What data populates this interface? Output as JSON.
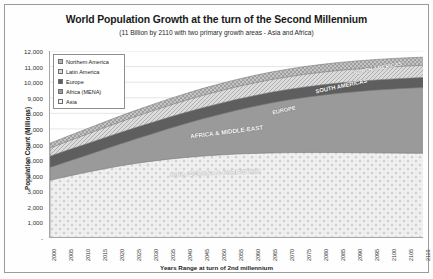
{
  "chart_data": {
    "type": "area",
    "stacked": true,
    "title": "World Population Growth at the turn of the Second Millennium",
    "subtitle": "(11 Billion  by  2110 with two primary growth areas - Asia and Africa)",
    "xlabel": "Years Range at turn of 2nd millennium",
    "ylabel": "Population Count (Millions)",
    "ylim": [
      0,
      12000
    ],
    "ytick_step": 1000,
    "yticks": [
      "-",
      "1,000",
      "2,000",
      "3,000",
      "4,000",
      "5,000",
      "6,000",
      "7,000",
      "8,000",
      "9,000",
      "10,000",
      "11,000",
      "12,000"
    ],
    "grid": true,
    "legend_position": "top-left-inside",
    "categories": [
      "2000",
      "2005",
      "2010",
      "2015",
      "2020",
      "2025",
      "2030",
      "2035",
      "2040",
      "2045",
      "2050",
      "2055",
      "2060",
      "2065",
      "2070",
      "2075",
      "2080",
      "2085",
      "2090",
      "2095",
      "2100",
      "2105",
      "2110"
    ],
    "series": [
      {
        "name": "Asia",
        "legend_label": "Asia",
        "band_label": "ASIA, OCEANA & PACIFIC RIM",
        "color": "#efefef",
        "pattern": "dotted-diamond",
        "values": [
          3700,
          3950,
          4180,
          4400,
          4600,
          4780,
          4930,
          5060,
          5170,
          5260,
          5330,
          5390,
          5430,
          5460,
          5480,
          5490,
          5490,
          5485,
          5475,
          5465,
          5455,
          5445,
          5435
        ]
      },
      {
        "name": "Africa (MENA)",
        "legend_label": "Africa (MENA)",
        "band_label": "AFRICA & MIDDLE-EAST",
        "color": "#9a9a9a",
        "pattern": "solid",
        "values": [
          820,
          940,
          1070,
          1220,
          1380,
          1560,
          1750,
          1960,
          2170,
          2390,
          2600,
          2810,
          3010,
          3200,
          3370,
          3530,
          3670,
          3800,
          3910,
          4010,
          4090,
          4160,
          4220
        ]
      },
      {
        "name": "Europe",
        "legend_label": "Europe",
        "band_label": "EUROPE",
        "color": "#5e5e5e",
        "pattern": "solid",
        "values": [
          730,
          735,
          738,
          740,
          740,
          737,
          733,
          728,
          722,
          715,
          708,
          700,
          692,
          685,
          678,
          672,
          667,
          662,
          658,
          654,
          650,
          647,
          644
        ]
      },
      {
        "name": "Latin America",
        "legend_label": "Latin America",
        "band_label": "SOUTH AMERICAS",
        "color": "#d8d8d8",
        "pattern": "hatch",
        "values": [
          520,
          560,
          600,
          640,
          675,
          705,
          732,
          755,
          774,
          789,
          800,
          808,
          813,
          815,
          815,
          813,
          810,
          806,
          801,
          796,
          791,
          786,
          781
        ]
      },
      {
        "name": "Northern America",
        "legend_label": "Northern America",
        "band_label": "NORTH AMERICAS",
        "color": "#b5b5b5",
        "pattern": "checker",
        "values": [
          313,
          330,
          346,
          362,
          378,
          394,
          409,
          423,
          436,
          448,
          459,
          469,
          478,
          486,
          493,
          499,
          505,
          510,
          514,
          518,
          522,
          525,
          528
        ]
      }
    ]
  },
  "legend": {
    "items": [
      {
        "label": "Northern America"
      },
      {
        "label": "Latin America"
      },
      {
        "label": "Europe"
      },
      {
        "label": "Africa (MENA)"
      },
      {
        "label": "Asia"
      }
    ]
  }
}
